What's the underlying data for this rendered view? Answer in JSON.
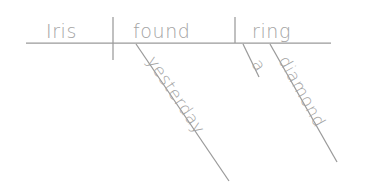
{
  "diagram": {
    "type": "reed-kellogg-sentence-diagram",
    "sentence": "Iris found a diamond ring yesterday",
    "ink_color": "#9a9a9a",
    "text_color": "#a3a3a3",
    "background_color": "#ffffff",
    "words": {
      "subject": "Iris",
      "verb": "found",
      "direct_object": "ring",
      "article": "a",
      "adjective": "diamond",
      "adverb": "yesterday"
    },
    "baseline": {
      "x1": 26,
      "y1": 43,
      "x2": 331,
      "y2": 43
    },
    "dividers": [
      {
        "name": "subject-verb-divider",
        "x1": 113,
        "y1": 17,
        "x2": 113,
        "y2": 60
      },
      {
        "name": "verb-object-divider",
        "x1": 235,
        "y1": 17,
        "x2": 235,
        "y2": 43
      }
    ],
    "modifier_lines": [
      {
        "name": "adverb-line",
        "x1": 136,
        "y1": 44,
        "x2": 229,
        "y2": 181
      },
      {
        "name": "article-line",
        "x1": 243,
        "y1": 44,
        "x2": 259,
        "y2": 77
      },
      {
        "name": "adjective-line",
        "x1": 270,
        "y1": 44,
        "x2": 337,
        "y2": 162
      }
    ],
    "word_placements": [
      {
        "name": "subject",
        "text": "Iris",
        "x": 46,
        "y": 38,
        "rotation": 0
      },
      {
        "name": "verb",
        "text": "found",
        "x": 133,
        "y": 38,
        "rotation": 0
      },
      {
        "name": "direct-object",
        "text": "ring",
        "x": 252,
        "y": 38,
        "rotation": 0
      },
      {
        "name": "article",
        "text": "a",
        "x": 251,
        "y": 64,
        "rotation": 56
      },
      {
        "name": "adjective",
        "text": "diamond",
        "x": 278,
        "y": 60,
        "rotation": 61
      },
      {
        "name": "adverb",
        "text": "yesterday",
        "x": 146,
        "y": 61,
        "rotation": 56
      }
    ]
  }
}
